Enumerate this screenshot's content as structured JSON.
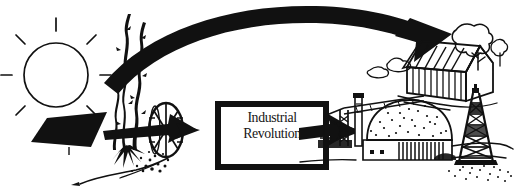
{
  "figure": {
    "background_color": "#ffffff",
    "ink_color": "#111111"
  },
  "central_box": {
    "line1": "Industrial",
    "line2": "Revolution",
    "border_color": "#111111",
    "fill_color": "#ffffff"
  },
  "elements": {
    "sun": {
      "label": "sun",
      "rays": 8
    },
    "solar_panel": {
      "label": "solar panel"
    },
    "plant": {
      "label": "plant biomass"
    },
    "water_wheel": {
      "label": "water wheel",
      "spokes": 10
    },
    "stream": {
      "label": "stream"
    },
    "arrow_into_box": {
      "label": "arrow into industrial revolution"
    },
    "arrow_out_of_box": {
      "label": "arrow out of industrial revolution"
    },
    "curved_arrow": {
      "label": "large curved arrow to house"
    },
    "house": {
      "label": "house barn"
    },
    "trees": {
      "label": "trees behind house"
    },
    "factory_dome": {
      "label": "domed factory building"
    },
    "crane": {
      "label": "construction crane"
    },
    "smokestack": {
      "label": "smokestack"
    },
    "oil_derrick": {
      "label": "oil derrick"
    },
    "ground": {
      "label": "ground line"
    }
  }
}
